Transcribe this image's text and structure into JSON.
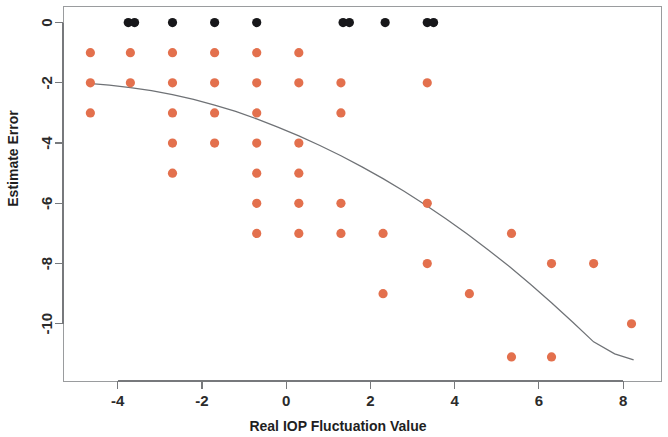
{
  "chart_data": {
    "type": "scatter",
    "title": "",
    "xlabel": "Real IOP Fluctuation Value",
    "ylabel": "Estimate Error",
    "xlim": [
      -5.3,
      8.9
    ],
    "ylim": [
      -11.9,
      0.55
    ],
    "xticks": [
      -4,
      -2,
      0,
      2,
      4,
      6,
      8
    ],
    "xticklabels": [
      "-4",
      "-2",
      "0",
      "2",
      "4",
      "6",
      "8"
    ],
    "yticks": [
      0,
      -2,
      -4,
      -6,
      -8,
      -10
    ],
    "yticklabels": [
      "0",
      "-2",
      "-4",
      "-6",
      "-8",
      "-10"
    ],
    "grid": false,
    "legend": null,
    "series": [
      {
        "name": "zero-error-points",
        "color": "#17171a",
        "marker": "circle",
        "points": [
          [
            -3.75,
            0
          ],
          [
            -3.6,
            0
          ],
          [
            -2.7,
            0
          ],
          [
            -1.7,
            0
          ],
          [
            -0.7,
            0
          ],
          [
            1.35,
            0
          ],
          [
            1.5,
            0
          ],
          [
            2.35,
            0
          ],
          [
            3.35,
            0
          ],
          [
            3.5,
            0
          ]
        ]
      },
      {
        "name": "estimate-error-points",
        "color": "#e3704d",
        "marker": "circle",
        "points": [
          [
            -4.65,
            -1
          ],
          [
            -4.65,
            -2
          ],
          [
            -4.65,
            -3
          ],
          [
            -3.7,
            -1
          ],
          [
            -3.7,
            -2
          ],
          [
            -2.7,
            -1
          ],
          [
            -2.7,
            -2
          ],
          [
            -2.7,
            -3
          ],
          [
            -2.7,
            -4
          ],
          [
            -2.7,
            -5
          ],
          [
            -1.7,
            -1
          ],
          [
            -1.7,
            -2
          ],
          [
            -1.7,
            -3
          ],
          [
            -1.7,
            -4
          ],
          [
            -0.7,
            -1
          ],
          [
            -0.7,
            -2
          ],
          [
            -0.7,
            -3
          ],
          [
            -0.7,
            -4
          ],
          [
            -0.7,
            -5
          ],
          [
            -0.7,
            -6
          ],
          [
            -0.7,
            -7
          ],
          [
            0.3,
            -1
          ],
          [
            0.3,
            -2
          ],
          [
            0.3,
            -4
          ],
          [
            0.3,
            -5
          ],
          [
            0.3,
            -6
          ],
          [
            0.3,
            -7
          ],
          [
            1.3,
            -2
          ],
          [
            1.3,
            -3
          ],
          [
            1.3,
            -6
          ],
          [
            1.3,
            -7
          ],
          [
            2.3,
            -7
          ],
          [
            2.3,
            -9
          ],
          [
            3.35,
            -2
          ],
          [
            3.35,
            -6
          ],
          [
            3.35,
            -8
          ],
          [
            4.35,
            -9
          ],
          [
            5.35,
            -7
          ],
          [
            5.35,
            -11.1
          ],
          [
            6.3,
            -8
          ],
          [
            6.3,
            -11.1
          ],
          [
            7.3,
            -8
          ],
          [
            8.2,
            -10
          ]
        ]
      }
    ],
    "fit_curve": {
      "name": "loess-fit-line",
      "color": "#6f7276",
      "points": [
        [
          -4.7,
          -2.02
        ],
        [
          -4.2,
          -2.08
        ],
        [
          -3.7,
          -2.16
        ],
        [
          -3.2,
          -2.26
        ],
        [
          -2.7,
          -2.39
        ],
        [
          -2.2,
          -2.55
        ],
        [
          -1.7,
          -2.74
        ],
        [
          -1.2,
          -2.95
        ],
        [
          -0.7,
          -3.2
        ],
        [
          -0.2,
          -3.47
        ],
        [
          0.3,
          -3.76
        ],
        [
          0.8,
          -4.08
        ],
        [
          1.3,
          -4.42
        ],
        [
          1.8,
          -4.79
        ],
        [
          2.3,
          -5.18
        ],
        [
          2.8,
          -5.6
        ],
        [
          3.3,
          -6.05
        ],
        [
          3.8,
          -6.52
        ],
        [
          4.3,
          -7.02
        ],
        [
          4.8,
          -7.55
        ],
        [
          5.3,
          -8.1
        ],
        [
          5.8,
          -8.69
        ],
        [
          6.3,
          -9.3
        ],
        [
          6.8,
          -9.94
        ],
        [
          7.3,
          -10.6
        ],
        [
          7.8,
          -11.0
        ],
        [
          8.25,
          -11.2
        ]
      ]
    }
  }
}
